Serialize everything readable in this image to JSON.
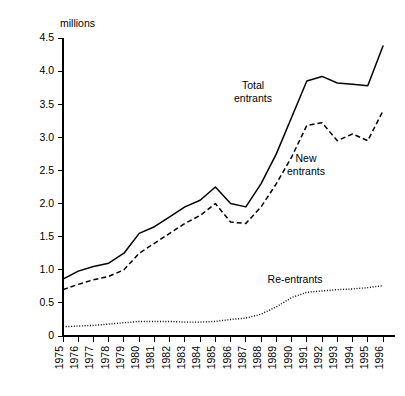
{
  "chart_data": {
    "type": "line",
    "title": "",
    "xlabel": "",
    "ylabel": "millions",
    "unit_label": "millions",
    "grid": false,
    "legend_position": "inline-annotations",
    "xlim": [
      1975,
      1996
    ],
    "ylim": [
      0,
      4.5
    ],
    "ytick_labels": [
      "0",
      "0.5",
      "1.0",
      "1.5",
      "2.0",
      "2.5",
      "3.0",
      "3.5",
      "4.0",
      "4.5"
    ],
    "ytick_values": [
      0,
      0.5,
      1.0,
      1.5,
      2.0,
      2.5,
      3.0,
      3.5,
      4.0,
      4.5
    ],
    "categories": [
      "1975",
      "1976",
      "1977",
      "1978",
      "1979",
      "1980",
      "1981",
      "1982",
      "1983",
      "1984",
      "1985",
      "1986",
      "1987",
      "1988",
      "1989",
      "1990",
      "1991",
      "1992",
      "1993",
      "1994",
      "1995",
      "1996"
    ],
    "x": [
      1975,
      1976,
      1977,
      1978,
      1979,
      1980,
      1981,
      1982,
      1983,
      1984,
      1985,
      1986,
      1987,
      1988,
      1989,
      1990,
      1991,
      1992,
      1993,
      1994,
      1995,
      1996
    ],
    "series": [
      {
        "name": "Total entrants",
        "style": "solid",
        "values": [
          0.86,
          0.98,
          1.05,
          1.1,
          1.25,
          1.55,
          1.65,
          1.8,
          1.95,
          2.05,
          2.25,
          2.0,
          1.95,
          2.3,
          2.75,
          3.3,
          3.85,
          3.92,
          3.82,
          3.8,
          3.78,
          4.38
        ]
      },
      {
        "name": "New entrants",
        "style": "dashed",
        "values": [
          0.7,
          0.78,
          0.85,
          0.9,
          1.0,
          1.25,
          1.4,
          1.55,
          1.7,
          1.82,
          2.0,
          1.72,
          1.7,
          1.95,
          2.3,
          2.7,
          3.18,
          3.22,
          2.95,
          3.05,
          2.95,
          3.4
        ]
      },
      {
        "name": "Re-entrants",
        "style": "dotted",
        "values": [
          0.14,
          0.15,
          0.16,
          0.18,
          0.2,
          0.22,
          0.22,
          0.22,
          0.21,
          0.21,
          0.22,
          0.25,
          0.27,
          0.33,
          0.44,
          0.58,
          0.66,
          0.68,
          0.7,
          0.71,
          0.73,
          0.76
        ]
      }
    ],
    "annotations": [
      {
        "text_line1": "Total",
        "text_line2": "entrants",
        "series": "Total entrants"
      },
      {
        "text_line1": "New",
        "text_line2": "entrants",
        "series": "New entrants"
      },
      {
        "text_line1": "Re-entrants",
        "text_line2": "",
        "series": "Re-entrants"
      }
    ]
  },
  "colors": {
    "background": "#ffffff",
    "axis": "#000000",
    "series": "#000000"
  }
}
